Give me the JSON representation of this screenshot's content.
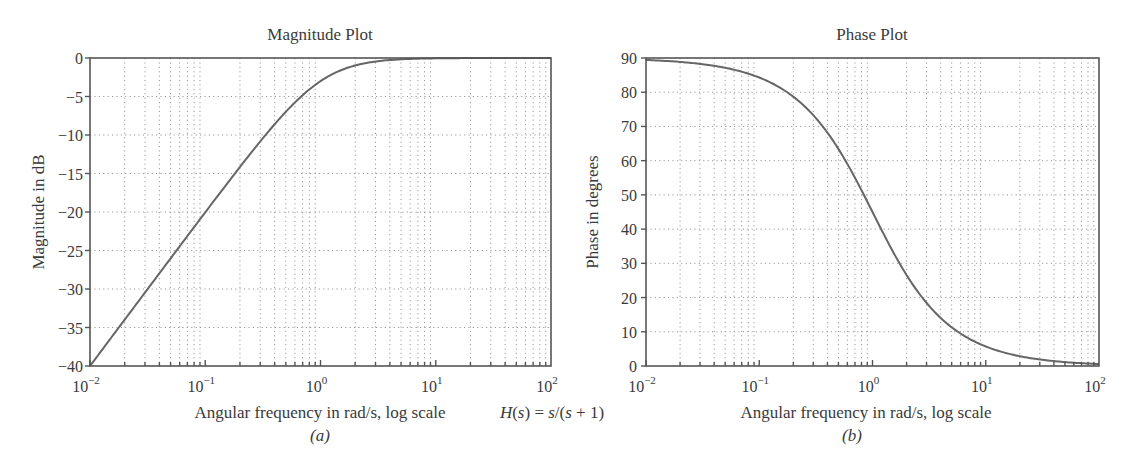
{
  "figure": {
    "equation": "H(s) = s/(s + 1)",
    "equation_parts": {
      "H": "H",
      "s1": "s",
      "mid": ") = ",
      "s2": "s",
      "s3": "s",
      "tail": " + 1)"
    }
  },
  "chart_data": [
    {
      "type": "line",
      "id": "a",
      "title": "Magnitude Plot",
      "caption": "(a)",
      "xlabel": "Angular frequency in rad/s, log scale",
      "ylabel": "Magnitude in dB",
      "xscale": "log",
      "xlim": [
        0.01,
        100
      ],
      "ylim": [
        -40,
        0
      ],
      "xticks": [
        "10^-2",
        "10^-1",
        "10^0",
        "10^1",
        "10^2"
      ],
      "xtick_bases": [
        "10",
        "10",
        "10",
        "10",
        "10"
      ],
      "xtick_exps": [
        "−2",
        "−1",
        "0",
        "1",
        "2"
      ],
      "yticks": [
        "0",
        "−5",
        "−10",
        "−15",
        "−20",
        "−25",
        "−30",
        "−35",
        "−40"
      ],
      "ytick_values": [
        0,
        -5,
        -10,
        -15,
        -20,
        -25,
        -30,
        -35,
        -40
      ],
      "grid": true,
      "series": [
        {
          "name": "|H(jω)| dB",
          "x": [
            0.01,
            0.02,
            0.05,
            0.1,
            0.2,
            0.3,
            0.5,
            0.7,
            1,
            1.5,
            2,
            3,
            5,
            10,
            20,
            50,
            100
          ],
          "y": [
            -40.0,
            -33.98,
            -26.03,
            -20.04,
            -14.15,
            -10.83,
            -6.99,
            -4.75,
            -3.01,
            -1.6,
            -0.97,
            -0.46,
            -0.17,
            -0.04,
            -0.01,
            0.0,
            0.0
          ]
        }
      ]
    },
    {
      "type": "line",
      "id": "b",
      "title": "Phase Plot",
      "caption": "(b)",
      "xlabel": "Angular frequency in rad/s, log scale",
      "ylabel": "Phase in degrees",
      "xscale": "log",
      "xlim": [
        0.01,
        100
      ],
      "ylim": [
        0,
        90
      ],
      "xticks": [
        "10^-2",
        "10^-1",
        "10^0",
        "10^1",
        "10^2"
      ],
      "xtick_bases": [
        "10",
        "10",
        "10",
        "10",
        "10"
      ],
      "xtick_exps": [
        "−2",
        "−1",
        "0",
        "1",
        "2"
      ],
      "yticks": [
        "90",
        "80",
        "70",
        "60",
        "50",
        "40",
        "30",
        "20",
        "10",
        "0"
      ],
      "ytick_values": [
        90,
        80,
        70,
        60,
        50,
        40,
        30,
        20,
        10,
        0
      ],
      "grid": true,
      "series": [
        {
          "name": "∠H(jω) deg",
          "x": [
            0.01,
            0.02,
            0.05,
            0.1,
            0.2,
            0.3,
            0.5,
            0.7,
            1,
            1.5,
            2,
            3,
            5,
            10,
            20,
            50,
            100
          ],
          "y": [
            89.43,
            88.85,
            87.14,
            84.29,
            78.69,
            73.3,
            63.43,
            55.01,
            45.0,
            33.69,
            26.57,
            18.43,
            11.31,
            5.71,
            2.86,
            1.15,
            0.57
          ]
        }
      ]
    }
  ]
}
